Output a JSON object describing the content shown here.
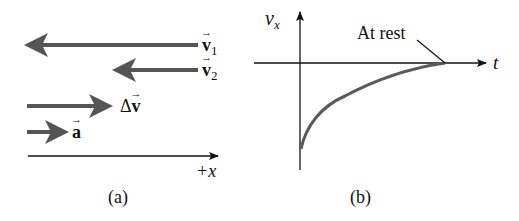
{
  "panel_a": {
    "caption": "(a)",
    "vectors": [
      {
        "name": "v1",
        "symbol": "v",
        "subscript": "1",
        "direction": "left",
        "length_px": 173
      },
      {
        "name": "v2",
        "symbol": "v",
        "subscript": "2",
        "direction": "left",
        "length_px": 85
      },
      {
        "name": "delta-v",
        "prefix": "Δ",
        "symbol": "v",
        "direction": "right",
        "length_px": 85
      },
      {
        "name": "a",
        "symbol": "a",
        "direction": "right",
        "length_px": 41
      }
    ],
    "axis_label": "+x"
  },
  "panel_b": {
    "caption": "(b)",
    "y_axis_label": "v",
    "y_axis_sub": "x",
    "x_axis_label": "t",
    "annotation": "At rest"
  },
  "colors": {
    "arrow": "#555555",
    "axis": "#111111",
    "curve": "#5a5a5a"
  }
}
